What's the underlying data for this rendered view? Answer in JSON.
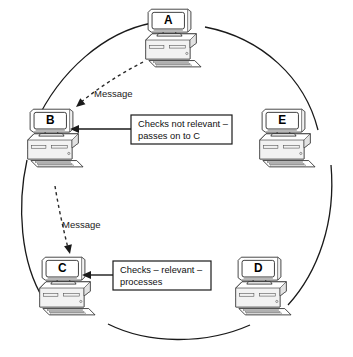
{
  "diagram": {
    "background_color": "#ffffff",
    "line_color": "#1a1a1a",
    "nodes": [
      {
        "id": "A",
        "label": "A",
        "position": "top"
      },
      {
        "id": "B",
        "label": "B",
        "position": "left"
      },
      {
        "id": "C",
        "label": "C",
        "position": "bottom-left"
      },
      {
        "id": "D",
        "label": "D",
        "position": "bottom-right"
      },
      {
        "id": "E",
        "label": "E",
        "position": "right"
      }
    ],
    "messages": [
      {
        "id": "msg-a-to-b",
        "label": "Message",
        "from": "A",
        "to": "B",
        "style": "dashed"
      },
      {
        "id": "msg-b-to-c",
        "label": "Message",
        "from": "B",
        "to": "C",
        "style": "dashed"
      }
    ],
    "callouts": [
      {
        "id": "callout-b",
        "target": "B",
        "line1": "Checks not relevant –",
        "line2": "passes on to C"
      },
      {
        "id": "callout-c",
        "target": "C",
        "line1": "Checks – relevant –",
        "line2": "processes"
      }
    ]
  }
}
